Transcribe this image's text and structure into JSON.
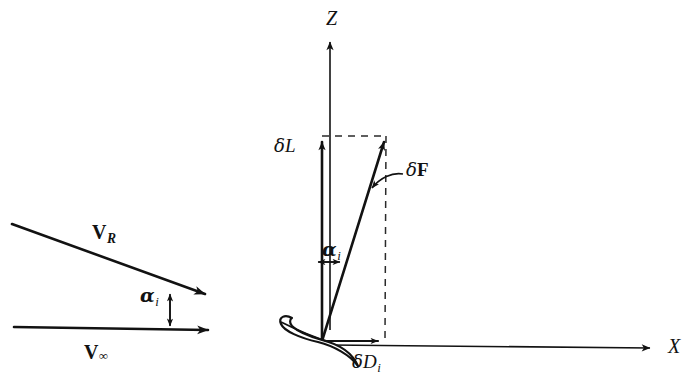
{
  "figure": {
    "background_color": "#ffffff",
    "ink_color": "#121212"
  },
  "left_diagram": {
    "name": "velocity-triangle",
    "labels": {
      "resultant_velocity": "V",
      "resultant_velocity_sub": "R",
      "freestream_velocity": "V",
      "freestream_velocity_sub": "∞",
      "induced_angle": "α",
      "induced_angle_sub": "i"
    },
    "geometry": {
      "vr_line_start": [
        12,
        224
      ],
      "vr_line_end": [
        216,
        298
      ],
      "vinf_line_start": [
        14,
        327
      ],
      "vinf_line_end": [
        220,
        331
      ],
      "angle_marker_x": 170,
      "angle_marker_top_y": 292,
      "angle_marker_bottom_y": 327
    }
  },
  "right_diagram": {
    "name": "force-resolution",
    "labels": {
      "z_axis": "Z",
      "x_axis": "X",
      "lift_increment": "δL",
      "lift_increment_delta": "δ",
      "lift_increment_sym": "L",
      "force_increment_delta": "δ",
      "force_increment_sym": "F",
      "induced_drag_delta": "δ",
      "induced_drag_sym": "D",
      "induced_drag_sub": "i",
      "induced_angle": "α",
      "induced_angle_sub": "i"
    },
    "geometry": {
      "origin": [
        322,
        341
      ],
      "z_axis_tip": [
        330,
        38
      ],
      "x_axis_tip": [
        658,
        348
      ],
      "lift_tip": [
        322,
        137
      ],
      "force_tip": [
        386,
        137
      ],
      "drag_tip": [
        385,
        341
      ],
      "angle_marker_y": 262,
      "angle_marker_left_x": 317,
      "angle_marker_right_x": 341
    },
    "airfoil": {
      "name": "airfoil-section",
      "leading_edge": [
        283,
        322
      ],
      "trailing_edge": [
        357,
        365
      ]
    }
  },
  "icons": {
    "arrowhead": "arrowhead-icon",
    "dashed_line": "dashed-construction-line"
  }
}
